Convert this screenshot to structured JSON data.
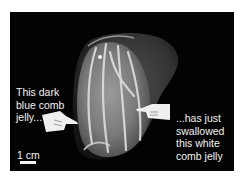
{
  "figure": {
    "background_color": "#030303",
    "label_color": "#f2f2f2"
  },
  "annotations": {
    "left_label": "This dark\nblue comb\njelly...",
    "right_label": "...has just\nswallowed\nthis white\ncomb jelly",
    "left_pointer": "pointing-hand-right-icon",
    "right_pointer": "pointing-hand-left-icon"
  },
  "scale_bar": {
    "label": "1 cm"
  }
}
